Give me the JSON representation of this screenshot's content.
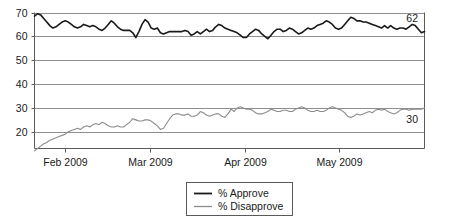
{
  "chart_data": {
    "type": "line",
    "title": "",
    "xlabel": "",
    "ylabel": "",
    "ylim": [
      13,
      70
    ],
    "yticks": [
      20,
      30,
      40,
      50,
      60,
      70
    ],
    "ytick_labels": [
      "20",
      "30",
      "40",
      "50",
      "60",
      "70"
    ],
    "grid": true,
    "grid_axis": "y",
    "xtick_labels": [
      "Feb 2009",
      "Mar 2009",
      "Apr 2009",
      "May 2009"
    ],
    "xtick_positions": [
      10,
      38,
      69,
      100
    ],
    "xlim": [
      0,
      128
    ],
    "legend_position": "bottom-center",
    "endpoint_labels": [
      {
        "series": "% Approve",
        "value": "62"
      },
      {
        "series": "% Disapprove",
        "value": "30"
      }
    ],
    "series": [
      {
        "name": "% Approve",
        "color": "#1a1a1a",
        "width": 1.6,
        "values": [
          68.5,
          69.5,
          69.0,
          67.5,
          66.0,
          64.5,
          63.5,
          64.0,
          65.0,
          66.0,
          66.5,
          66.0,
          65.0,
          64.0,
          63.5,
          64.0,
          65.0,
          64.5,
          64.0,
          64.5,
          64.0,
          63.0,
          62.5,
          63.5,
          65.0,
          66.5,
          65.5,
          64.0,
          63.0,
          62.5,
          62.5,
          62.5,
          61.5,
          59.5,
          62.0,
          65.0,
          67.0,
          66.0,
          63.5,
          63.0,
          63.5,
          61.5,
          61.0,
          61.5,
          62.0,
          62.0,
          62.0,
          62.0,
          62.0,
          62.5,
          62.0,
          60.5,
          61.0,
          62.0,
          61.0,
          62.0,
          63.0,
          62.0,
          62.5,
          64.0,
          65.0,
          64.5,
          63.5,
          63.0,
          62.5,
          62.0,
          61.5,
          60.5,
          59.5,
          59.5,
          61.0,
          62.0,
          63.0,
          62.5,
          61.0,
          60.0,
          59.0,
          60.5,
          62.0,
          63.0,
          63.0,
          62.0,
          62.5,
          63.5,
          63.0,
          62.0,
          61.0,
          61.5,
          62.5,
          63.5,
          63.0,
          63.5,
          64.5,
          65.0,
          65.5,
          66.5,
          66.0,
          65.0,
          63.5,
          63.0,
          63.5,
          65.0,
          66.5,
          68.0,
          67.5,
          66.5,
          66.5,
          66.0,
          66.0,
          65.5,
          65.0,
          64.5,
          64.0,
          63.5,
          64.5,
          63.5,
          64.5,
          63.5,
          63.0,
          63.5,
          63.5,
          63.0,
          64.0,
          65.0,
          64.5,
          63.0,
          61.5,
          62.0
        ]
      },
      {
        "name": "% Disapprove",
        "color": "#8c8c8c",
        "width": 1.1,
        "values": [
          12.0,
          13.0,
          14.0,
          15.0,
          15.5,
          16.5,
          17.0,
          17.5,
          18.0,
          18.5,
          19.0,
          20.0,
          20.5,
          21.0,
          21.5,
          21.0,
          22.0,
          22.5,
          22.0,
          23.0,
          23.5,
          23.0,
          24.0,
          23.5,
          22.5,
          22.0,
          22.0,
          22.5,
          22.0,
          22.0,
          23.0,
          24.0,
          25.5,
          25.0,
          24.5,
          24.5,
          25.0,
          25.0,
          24.5,
          23.5,
          22.5,
          21.0,
          21.5,
          23.5,
          25.5,
          27.0,
          27.5,
          27.5,
          27.0,
          27.0,
          27.5,
          26.5,
          26.5,
          27.0,
          28.5,
          28.0,
          27.0,
          26.5,
          27.0,
          27.5,
          27.5,
          26.5,
          26.0,
          27.5,
          29.5,
          28.5,
          30.0,
          30.5,
          30.0,
          29.5,
          29.5,
          29.0,
          28.0,
          27.5,
          27.5,
          28.0,
          28.5,
          29.5,
          29.0,
          28.5,
          28.5,
          29.0,
          29.0,
          28.5,
          28.5,
          29.5,
          30.0,
          30.5,
          30.0,
          29.0,
          28.5,
          28.5,
          29.0,
          28.5,
          28.5,
          29.0,
          30.0,
          30.5,
          30.0,
          29.5,
          29.0,
          28.0,
          26.5,
          26.0,
          26.5,
          27.5,
          27.0,
          27.5,
          28.0,
          28.5,
          28.0,
          29.0,
          29.5,
          29.0,
          29.5,
          28.5,
          28.0,
          27.5,
          28.0,
          29.0,
          29.5,
          29.5,
          29.0,
          29.5,
          29.5,
          29.5,
          29.5,
          30.0
        ]
      }
    ]
  },
  "legend": {
    "items": [
      {
        "label": "% Approve",
        "swatch_name": "legend-swatch-approve"
      },
      {
        "label": "% Disapprove",
        "swatch_name": "legend-swatch-disapprove"
      }
    ]
  },
  "colors": {
    "approve": "#1a1a1a",
    "disapprove": "#8c8c8c",
    "grid": "#8f8f8f",
    "axis": "#5a5a5a",
    "text": "#1a1a1a",
    "background": "#ffffff"
  }
}
